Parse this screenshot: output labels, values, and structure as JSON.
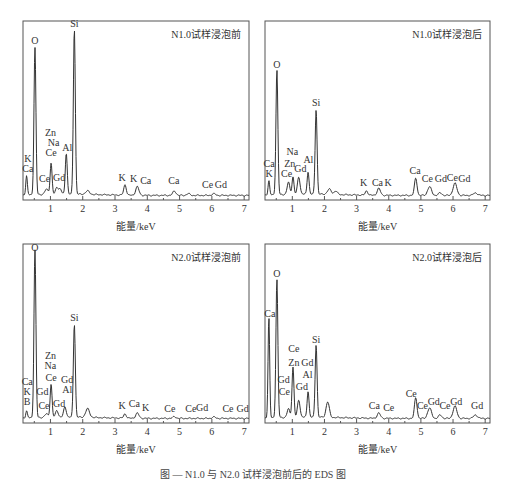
{
  "figure": {
    "caption": "图 — N1.0 与 N2.0 试样浸泡前后的 EDS 图",
    "xlabel": "能量/keV"
  },
  "chart_data": [
    {
      "type": "line",
      "title": "N1.0试样浸泡前",
      "xlabel": "能量/keV",
      "ylabel": "",
      "xlim": [
        0.15,
        7.15
      ],
      "xticks": [
        1,
        2,
        3,
        4,
        5,
        6,
        7
      ],
      "ylim": [
        0,
        100
      ],
      "grid": false,
      "legend": "none",
      "peaks": [
        {
          "x": 0.26,
          "h": 11,
          "w": 0.025
        },
        {
          "x": 0.52,
          "h": 85,
          "w": 0.03
        },
        {
          "x": 0.88,
          "h": 3,
          "w": 0.05
        },
        {
          "x": 1.02,
          "h": 18,
          "w": 0.03
        },
        {
          "x": 1.2,
          "h": 4,
          "w": 0.04
        },
        {
          "x": 1.3,
          "h": 3,
          "w": 0.04
        },
        {
          "x": 1.49,
          "h": 24,
          "w": 0.03
        },
        {
          "x": 1.74,
          "h": 96,
          "w": 0.03
        },
        {
          "x": 2.15,
          "h": 2,
          "w": 0.06
        },
        {
          "x": 3.31,
          "h": 6,
          "w": 0.04
        },
        {
          "x": 3.69,
          "h": 5,
          "w": 0.05
        },
        {
          "x": 4.84,
          "h": 2.5,
          "w": 0.05
        },
        {
          "x": 5.27,
          "h": 1,
          "w": 0.05
        },
        {
          "x": 6.06,
          "h": 1,
          "w": 0.05
        }
      ],
      "baseline": 1.5,
      "annotations": [
        {
          "text": "Si",
          "x": 1.74,
          "y": 99
        },
        {
          "text": "O",
          "x": 0.52,
          "y": 89
        },
        {
          "text": "Zn",
          "x": 1.0,
          "y": 36
        },
        {
          "text": "Na",
          "x": 1.1,
          "y": 30
        },
        {
          "text": "Ce",
          "x": 1.02,
          "y": 24
        },
        {
          "text": "Al",
          "x": 1.52,
          "y": 27
        },
        {
          "text": "K",
          "x": 0.3,
          "y": 21
        },
        {
          "text": "Ca",
          "x": 0.3,
          "y": 15
        },
        {
          "text": "Ce",
          "x": 0.82,
          "y": 9
        },
        {
          "text": "Gd",
          "x": 1.27,
          "y": 10
        },
        {
          "text": "K",
          "x": 3.22,
          "y": 10
        },
        {
          "text": "K",
          "x": 3.58,
          "y": 9
        },
        {
          "text": "Ca",
          "x": 3.95,
          "y": 8
        },
        {
          "text": "Ca",
          "x": 4.82,
          "y": 8
        },
        {
          "text": "Ce",
          "x": 5.87,
          "y": 6
        },
        {
          "text": "Gd",
          "x": 6.28,
          "y": 6
        }
      ]
    },
    {
      "type": "line",
      "title": "N1.0试样浸泡后",
      "xlabel": "能量/keV",
      "ylabel": "",
      "xlim": [
        0.15,
        7.15
      ],
      "xticks": [
        1,
        2,
        3,
        4,
        5,
        6,
        7
      ],
      "ylim": [
        0,
        100
      ],
      "grid": false,
      "legend": "none",
      "peaks": [
        {
          "x": 0.27,
          "h": 8,
          "w": 0.025
        },
        {
          "x": 0.52,
          "h": 72,
          "w": 0.03
        },
        {
          "x": 0.88,
          "h": 7,
          "w": 0.04
        },
        {
          "x": 1.02,
          "h": 10,
          "w": 0.03
        },
        {
          "x": 1.2,
          "h": 10,
          "w": 0.04
        },
        {
          "x": 1.49,
          "h": 13,
          "w": 0.03
        },
        {
          "x": 1.74,
          "h": 49,
          "w": 0.03
        },
        {
          "x": 2.15,
          "h": 3,
          "w": 0.06
        },
        {
          "x": 2.35,
          "h": 2,
          "w": 0.05
        },
        {
          "x": 3.31,
          "h": 2.5,
          "w": 0.04
        },
        {
          "x": 3.69,
          "h": 4,
          "w": 0.05
        },
        {
          "x": 4.84,
          "h": 10,
          "w": 0.04
        },
        {
          "x": 5.27,
          "h": 5,
          "w": 0.06
        },
        {
          "x": 5.6,
          "h": 1.5,
          "w": 0.05
        },
        {
          "x": 6.06,
          "h": 7,
          "w": 0.06
        },
        {
          "x": 6.7,
          "h": 1.5,
          "w": 0.06
        }
      ],
      "baseline": 1.5,
      "annotations": [
        {
          "text": "O",
          "x": 0.52,
          "y": 75
        },
        {
          "text": "Si",
          "x": 1.74,
          "y": 53
        },
        {
          "text": "Na",
          "x": 1.0,
          "y": 25
        },
        {
          "text": "Al",
          "x": 1.5,
          "y": 20
        },
        {
          "text": "Ca",
          "x": 0.28,
          "y": 18
        },
        {
          "text": "Zn",
          "x": 0.92,
          "y": 18
        },
        {
          "text": "Gd",
          "x": 1.25,
          "y": 15
        },
        {
          "text": "K",
          "x": 0.28,
          "y": 12
        },
        {
          "text": "Ce",
          "x": 0.82,
          "y": 12
        },
        {
          "text": "K",
          "x": 3.22,
          "y": 7
        },
        {
          "text": "Ca",
          "x": 3.65,
          "y": 7
        },
        {
          "text": "K",
          "x": 3.98,
          "y": 7
        },
        {
          "text": "Ca",
          "x": 4.82,
          "y": 14
        },
        {
          "text": "Ce",
          "x": 5.2,
          "y": 9
        },
        {
          "text": "Gd",
          "x": 5.62,
          "y": 9
        },
        {
          "text": "Ce",
          "x": 5.98,
          "y": 10
        },
        {
          "text": "Gd",
          "x": 6.35,
          "y": 9
        }
      ]
    },
    {
      "type": "line",
      "title": "N2.0试样浸泡前",
      "xlabel": "能量/keV",
      "ylabel": "",
      "xlim": [
        0.15,
        7.15
      ],
      "xticks": [
        1,
        2,
        3,
        4,
        5,
        6,
        7
      ],
      "ylim": [
        0,
        100
      ],
      "grid": false,
      "legend": "none",
      "peaks": [
        {
          "x": 0.26,
          "h": 4,
          "w": 0.025
        },
        {
          "x": 0.52,
          "h": 97,
          "w": 0.03
        },
        {
          "x": 0.88,
          "h": 2,
          "w": 0.05
        },
        {
          "x": 1.02,
          "h": 19,
          "w": 0.03
        },
        {
          "x": 1.2,
          "h": 4,
          "w": 0.04
        },
        {
          "x": 1.45,
          "h": 6,
          "w": 0.04
        },
        {
          "x": 1.74,
          "h": 54,
          "w": 0.03
        },
        {
          "x": 2.15,
          "h": 5,
          "w": 0.06
        },
        {
          "x": 3.31,
          "h": 2.5,
          "w": 0.04
        },
        {
          "x": 3.69,
          "h": 3,
          "w": 0.05
        },
        {
          "x": 4.84,
          "h": 1,
          "w": 0.05
        },
        {
          "x": 6.06,
          "h": 0.8,
          "w": 0.05
        }
      ],
      "baseline": 1.5,
      "annotations": [
        {
          "text": "O",
          "x": 0.52,
          "y": 98
        },
        {
          "text": "Si",
          "x": 1.74,
          "y": 58
        },
        {
          "text": "Zn",
          "x": 1.0,
          "y": 36
        },
        {
          "text": "Na",
          "x": 1.0,
          "y": 30
        },
        {
          "text": "Ce",
          "x": 1.02,
          "y": 23
        },
        {
          "text": "Gd",
          "x": 1.52,
          "y": 22
        },
        {
          "text": "Al",
          "x": 1.52,
          "y": 16
        },
        {
          "text": "Ca",
          "x": 0.28,
          "y": 21
        },
        {
          "text": "K",
          "x": 0.28,
          "y": 15
        },
        {
          "text": "B",
          "x": 0.28,
          "y": 9
        },
        {
          "text": "Gd",
          "x": 0.75,
          "y": 15
        },
        {
          "text": "Ce",
          "x": 0.8,
          "y": 7
        },
        {
          "text": "Gd",
          "x": 1.27,
          "y": 8
        },
        {
          "text": "K",
          "x": 3.22,
          "y": 7
        },
        {
          "text": "Ca",
          "x": 3.6,
          "y": 8
        },
        {
          "text": "K",
          "x": 3.95,
          "y": 6
        },
        {
          "text": "Ce",
          "x": 4.7,
          "y": 5
        },
        {
          "text": "Ce",
          "x": 5.35,
          "y": 5
        },
        {
          "text": "Gd",
          "x": 5.7,
          "y": 6
        },
        {
          "text": "Ce",
          "x": 6.5,
          "y": 5
        },
        {
          "text": "Gd",
          "x": 6.95,
          "y": 5
        }
      ]
    },
    {
      "type": "line",
      "title": "N2.0试样浸泡后",
      "xlabel": "能量/keV",
      "ylabel": "",
      "xlim": [
        0.15,
        7.15
      ],
      "xticks": [
        1,
        2,
        3,
        4,
        5,
        6,
        7
      ],
      "ylim": [
        0,
        100
      ],
      "grid": false,
      "legend": "none",
      "peaks": [
        {
          "x": 0.27,
          "h": 58,
          "w": 0.025
        },
        {
          "x": 0.52,
          "h": 80,
          "w": 0.03
        },
        {
          "x": 0.88,
          "h": 5,
          "w": 0.04
        },
        {
          "x": 1.02,
          "h": 29,
          "w": 0.03
        },
        {
          "x": 1.2,
          "h": 10,
          "w": 0.04
        },
        {
          "x": 1.49,
          "h": 15,
          "w": 0.03
        },
        {
          "x": 1.74,
          "h": 42,
          "w": 0.03
        },
        {
          "x": 2.1,
          "h": 9,
          "w": 0.05
        },
        {
          "x": 3.69,
          "h": 3,
          "w": 0.05
        },
        {
          "x": 4.84,
          "h": 12,
          "w": 0.04
        },
        {
          "x": 5.27,
          "h": 6,
          "w": 0.06
        },
        {
          "x": 5.6,
          "h": 2,
          "w": 0.05
        },
        {
          "x": 6.06,
          "h": 7,
          "w": 0.06
        },
        {
          "x": 6.7,
          "h": 2,
          "w": 0.06
        }
      ],
      "baseline": 1.5,
      "annotations": [
        {
          "text": "O",
          "x": 0.52,
          "y": 83
        },
        {
          "text": "Ca",
          "x": 0.3,
          "y": 60
        },
        {
          "text": "Si",
          "x": 1.74,
          "y": 45
        },
        {
          "text": "Ce",
          "x": 1.05,
          "y": 40
        },
        {
          "text": "Zn",
          "x": 1.05,
          "y": 32
        },
        {
          "text": "Gd",
          "x": 1.47,
          "y": 32
        },
        {
          "text": "Al",
          "x": 1.47,
          "y": 25
        },
        {
          "text": "Gd",
          "x": 0.73,
          "y": 22
        },
        {
          "text": "Ce",
          "x": 0.75,
          "y": 15
        },
        {
          "text": "Gd",
          "x": 1.3,
          "y": 18
        },
        {
          "text": "Ca",
          "x": 3.55,
          "y": 7
        },
        {
          "text": "Ce",
          "x": 4.0,
          "y": 6
        },
        {
          "text": "Ce",
          "x": 4.7,
          "y": 14
        },
        {
          "text": "Ce",
          "x": 5.05,
          "y": 7
        },
        {
          "text": "Gd",
          "x": 5.4,
          "y": 9
        },
        {
          "text": "Ce",
          "x": 5.75,
          "y": 7
        },
        {
          "text": "Gd",
          "x": 6.1,
          "y": 9
        },
        {
          "text": "Gd",
          "x": 6.75,
          "y": 7
        }
      ]
    }
  ],
  "layout": {
    "panels": [
      {
        "left": 0,
        "top": 0,
        "frame": [
          23,
          21,
          249,
          200
        ]
      },
      {
        "left": 253,
        "top": 0,
        "frame": [
          12,
          21,
          237,
          200
        ]
      },
      {
        "left": 0,
        "top": 232,
        "frame": [
          23,
          12,
          249,
          191
        ]
      },
      {
        "left": 253,
        "top": 232,
        "frame": [
          12,
          12,
          237,
          191
        ]
      }
    ],
    "colors": {
      "line": "#333333",
      "frame": "#555555",
      "text": "#333333",
      "background": "#ffffff"
    }
  }
}
